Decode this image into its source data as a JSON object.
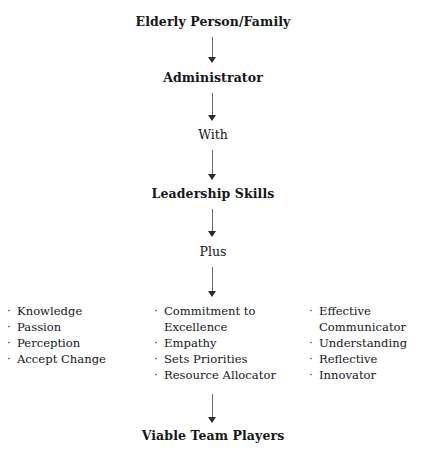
{
  "diagram": {
    "background_color": "#ffffff",
    "text_color": "#16161a",
    "arrow_color": "#6b6b70",
    "bullet_glyph": "·"
  },
  "nodes": {
    "start": "Elderly Person/Family",
    "administrator": "Administrator",
    "with": "With",
    "leadership_skills": "Leadership Skills",
    "plus": "Plus",
    "outcome": "Viable Team Players"
  },
  "columns": {
    "left": {
      "items": [
        "Knowledge",
        "Passion",
        "Perception",
        "Accept Change"
      ]
    },
    "middle": {
      "items": [
        "Commitment to",
        "Excellence",
        "Empathy",
        "Sets Priorities",
        "Resource Allocator"
      ]
    },
    "right": {
      "items": [
        "Effective",
        "Communicator",
        "Understanding",
        "Reflective",
        "Innovator"
      ]
    }
  }
}
